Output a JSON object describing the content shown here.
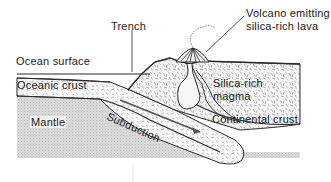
{
  "diagram": {
    "type": "cross-section",
    "labels": {
      "trench": "Trench",
      "volcano_line1": "Volcano emitting",
      "volcano_line2": "silica-rich lava",
      "ocean_surface": "Ocean surface",
      "oceanic_crust": "Oceanic crust",
      "silica_magma_line1": "Silica-rich",
      "silica_magma_line2": "magma",
      "mantle": "Mantle",
      "subduction": "Subduction",
      "continental_crust": "Continental crust"
    },
    "colors": {
      "line": "#2a2a2a",
      "mantle_fill": "#d9d9d9",
      "crust_fill": "#f4f4f4",
      "texture": "#8a8a8a",
      "background": "#ffffff"
    }
  }
}
